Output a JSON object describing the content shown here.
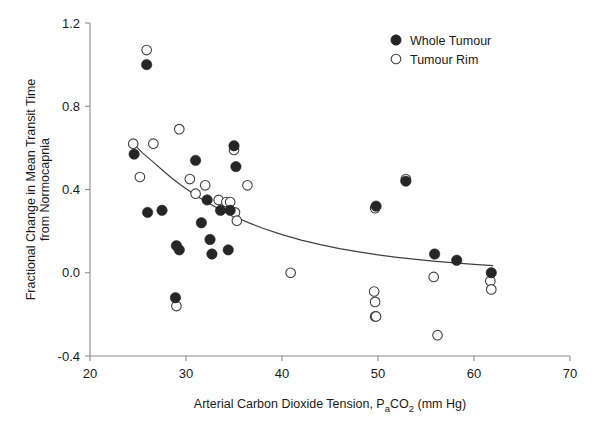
{
  "chart_data": {
    "type": "scatter",
    "title": "",
    "xlabel": "Arterial Carbon Dioxide Tension, PaCO2 (mm Hg)",
    "xlabel_parts": {
      "lead": "Arterial Carbon Dioxide Tension, P",
      "sub1": "a",
      "mid": "CO",
      "sub2": "2",
      "tail": " (mm Hg)"
    },
    "ylabel_line1": "Fractional Change in Mean Transit Time",
    "ylabel_line2": "from Normocapnia",
    "xlim": [
      20,
      70
    ],
    "ylim": [
      -0.4,
      1.2
    ],
    "xticks": [
      20,
      30,
      40,
      50,
      60,
      70
    ],
    "xtick_labels": [
      "20",
      "30",
      "40",
      "50",
      "60",
      "70"
    ],
    "yticks": [
      -0.4,
      0.0,
      0.4,
      0.8,
      1.2
    ],
    "ytick_labels": [
      "-0.4",
      "0.0",
      "0.4",
      "0.8",
      "1.2"
    ],
    "grid": false,
    "legend_position": "top-right",
    "marker_radius": 5.2,
    "colors": {
      "filled_marker": "#262626",
      "open_marker_stroke": "#404040",
      "open_marker_fill": "#ffffff",
      "axis": "#8c8c8c",
      "fit_line": "#404040",
      "text": "#1a1a1a",
      "background": "#ffffff"
    },
    "series": [
      {
        "name": "Whole Tumour",
        "marker": "filled-circle",
        "points": [
          [
            25.9,
            1.0
          ],
          [
            24.6,
            0.57
          ],
          [
            31.0,
            0.54
          ],
          [
            35.0,
            0.61
          ],
          [
            35.2,
            0.51
          ],
          [
            32.2,
            0.35
          ],
          [
            34.6,
            0.3
          ],
          [
            33.6,
            0.3
          ],
          [
            26.0,
            0.29
          ],
          [
            27.5,
            0.3
          ],
          [
            31.6,
            0.24
          ],
          [
            32.5,
            0.16
          ],
          [
            29.0,
            0.13
          ],
          [
            29.3,
            0.11
          ],
          [
            32.7,
            0.09
          ],
          [
            34.4,
            0.11
          ],
          [
            49.8,
            0.32
          ],
          [
            52.9,
            0.44
          ],
          [
            55.9,
            0.09
          ],
          [
            58.2,
            0.06
          ],
          [
            61.8,
            0.0
          ],
          [
            28.9,
            -0.12
          ]
        ]
      },
      {
        "name": "Tumour Rim",
        "marker": "open-circle",
        "points": [
          [
            25.9,
            1.07
          ],
          [
            24.5,
            0.62
          ],
          [
            26.6,
            0.62
          ],
          [
            29.3,
            0.69
          ],
          [
            25.2,
            0.46
          ],
          [
            30.4,
            0.45
          ],
          [
            32.0,
            0.42
          ],
          [
            31.0,
            0.38
          ],
          [
            33.4,
            0.35
          ],
          [
            34.2,
            0.34
          ],
          [
            34.6,
            0.34
          ],
          [
            35.0,
            0.59
          ],
          [
            36.4,
            0.42
          ],
          [
            35.1,
            0.29
          ],
          [
            35.3,
            0.25
          ],
          [
            40.9,
            0.0
          ],
          [
            49.7,
            0.31
          ],
          [
            52.9,
            0.45
          ],
          [
            55.8,
            -0.02
          ],
          [
            49.6,
            -0.09
          ],
          [
            49.7,
            -0.14
          ],
          [
            49.7,
            -0.21
          ],
          [
            49.8,
            -0.21
          ],
          [
            56.2,
            -0.3
          ],
          [
            61.7,
            -0.04
          ],
          [
            61.8,
            -0.08
          ],
          [
            29.0,
            -0.16
          ]
        ]
      }
    ],
    "fit_curve": {
      "name": "exponential-decay-fit",
      "description": "monotonic decreasing curve fitted through data",
      "points": [
        [
          24.4,
          0.625
        ],
        [
          25.5,
          0.575
        ],
        [
          26.5,
          0.535
        ],
        [
          27.5,
          0.495
        ],
        [
          28.5,
          0.455
        ],
        [
          29.5,
          0.42
        ],
        [
          30.5,
          0.388
        ],
        [
          31.5,
          0.358
        ],
        [
          32.5,
          0.33
        ],
        [
          33.5,
          0.305
        ],
        [
          34.5,
          0.282
        ],
        [
          35.5,
          0.261
        ],
        [
          36.5,
          0.241
        ],
        [
          38.0,
          0.214
        ],
        [
          40.0,
          0.183
        ],
        [
          42.0,
          0.157
        ],
        [
          44.0,
          0.135
        ],
        [
          46.0,
          0.116
        ],
        [
          48.0,
          0.1
        ],
        [
          50.0,
          0.086
        ],
        [
          52.0,
          0.074
        ],
        [
          54.0,
          0.064
        ],
        [
          56.0,
          0.055
        ],
        [
          58.0,
          0.047
        ],
        [
          60.0,
          0.04
        ],
        [
          62.0,
          0.034
        ]
      ]
    },
    "legend": [
      {
        "label": "Whole Tumour",
        "marker": "filled-circle"
      },
      {
        "label": "Tumour Rim",
        "marker": "open-circle"
      }
    ]
  }
}
